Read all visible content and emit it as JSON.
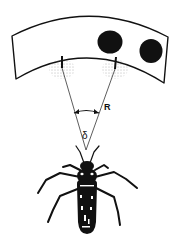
{
  "figure": {
    "labels": {
      "distance": "R",
      "angle": "δ"
    },
    "elements": {
      "screen": "curved stimulus screen",
      "stimuli": [
        "black dot",
        "black dot"
      ],
      "receptive_fields": [
        "left receptive field",
        "right receptive field"
      ],
      "observer": "insect (bug)"
    },
    "colors": {
      "ink": "#111111",
      "background": "#ffffff"
    }
  }
}
